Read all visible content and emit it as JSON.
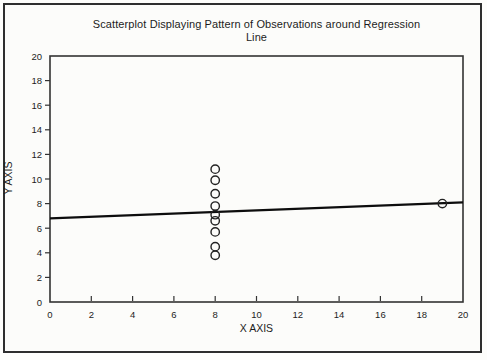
{
  "figure": {
    "title_line1": "Scatterplot Displaying Pattern of Observations around Regression",
    "title_line2": "Line",
    "x_axis_label": "X AXIS",
    "y_axis_label": "Y AXIS"
  },
  "chart_data": {
    "type": "scatter",
    "title": "Scatterplot Displaying Pattern of Observations around Regression Line",
    "xlabel": "X AXIS",
    "ylabel": "Y AXIS",
    "xlim": [
      0,
      20
    ],
    "ylim": [
      0,
      20
    ],
    "x_ticks": [
      0,
      2,
      4,
      6,
      8,
      10,
      12,
      14,
      16,
      18,
      20
    ],
    "y_ticks": [
      0,
      2,
      4,
      6,
      8,
      10,
      12,
      14,
      16,
      18,
      20
    ],
    "grid": false,
    "marker": "open-circle",
    "points": [
      {
        "x": 8,
        "y": 10.8
      },
      {
        "x": 8,
        "y": 9.9
      },
      {
        "x": 8,
        "y": 8.8
      },
      {
        "x": 8,
        "y": 7.8
      },
      {
        "x": 8,
        "y": 7.1
      },
      {
        "x": 8,
        "y": 6.6
      },
      {
        "x": 8,
        "y": 5.7
      },
      {
        "x": 8,
        "y": 4.5
      },
      {
        "x": 8,
        "y": 3.8
      },
      {
        "x": 19,
        "y": 8.0
      }
    ],
    "regression_line": {
      "x1": 0,
      "y1": 6.8,
      "x2": 20,
      "y2": 8.1
    },
    "colors": {
      "regression_line": "#0d0d0d",
      "marker_stroke": "#222222",
      "axis": "#333333",
      "tick": "#333333",
      "text": "#1c1c1c"
    }
  }
}
